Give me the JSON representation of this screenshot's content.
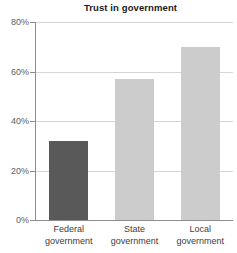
{
  "chart_data": {
    "type": "bar",
    "title": "Trust in government",
    "xlabel": "",
    "ylabel": "",
    "categories": [
      "Federal government",
      "State government",
      "Local government"
    ],
    "category_lines": [
      [
        "Federal",
        "government"
      ],
      [
        "State",
        "government"
      ],
      [
        "Local",
        "government"
      ]
    ],
    "values": [
      32,
      57,
      70
    ],
    "value_labels": [
      "32%",
      "57%",
      "70%"
    ],
    "ylim": [
      0,
      80
    ],
    "yticks": [
      0,
      20,
      40,
      60,
      80
    ],
    "ytick_labels": [
      "0%",
      "20%",
      "40%",
      "60%",
      "80%"
    ],
    "grid": true,
    "legend": false,
    "bar_colors": [
      "#595959",
      "#cccccc",
      "#cccccc"
    ],
    "background_color": "#ffffff",
    "gridline_color": "#d6d6d6",
    "axis_color": "#8c8c8c"
  }
}
